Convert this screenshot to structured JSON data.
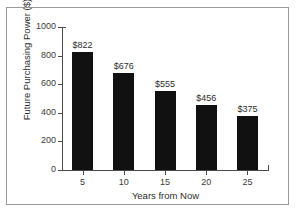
{
  "chart_data": {
    "type": "bar",
    "title": "",
    "xlabel": "Years from Now",
    "ylabel": "Future Purchasing Power ($)",
    "categories": [
      "5",
      "10",
      "15",
      "20",
      "25"
    ],
    "values": [
      822,
      676,
      555,
      456,
      375
    ],
    "data_labels": [
      "$822",
      "$676",
      "$555",
      "$456",
      "$375"
    ],
    "ylim": [
      0,
      1000
    ],
    "yticks": [
      0,
      200,
      400,
      600,
      800,
      1000
    ],
    "ytick_labels": [
      "0",
      "200",
      "400",
      "600",
      "800",
      "1000"
    ],
    "grid": false,
    "legend": false,
    "bar_color": "#111111",
    "axis_color": "#4a4a4a",
    "text_color": "#2d2d2d",
    "background": "#ffffff",
    "border_color": "#9a9a9a"
  }
}
